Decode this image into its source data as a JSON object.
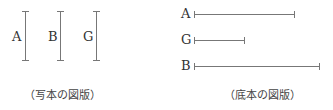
{
  "left_figure": {
    "caption": "（写本の図版）",
    "bars": [
      {
        "label": "A",
        "x": 25,
        "y1": 11,
        "y2": 61
      },
      {
        "label": "B",
        "x": 60,
        "y1": 11,
        "y2": 61
      },
      {
        "label": "G",
        "x": 96,
        "y1": 11,
        "y2": 61
      }
    ]
  },
  "right_figure": {
    "caption": "（底本の図版）",
    "bars": [
      {
        "label": "A",
        "y": 14,
        "x1": 194,
        "x2": 294
      },
      {
        "label": "G",
        "y": 40,
        "x1": 194,
        "x2": 244
      },
      {
        "label": "B",
        "y": 66,
        "x1": 194,
        "x2": 319
      }
    ]
  },
  "colors": {
    "line": "#777777",
    "text": "#333333"
  }
}
